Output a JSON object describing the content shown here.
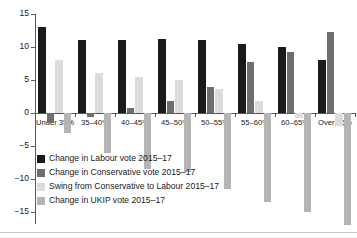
{
  "chart_data": {
    "type": "bar",
    "title": "",
    "xlabel": "",
    "ylabel": "",
    "ylim": [
      -20,
      15
    ],
    "yticks": [
      15,
      10,
      5,
      0,
      -5,
      -10,
      -15,
      -20
    ],
    "ytick_labels": [
      "15",
      "10",
      "5",
      "0",
      "−5",
      "−10",
      "−15",
      "−20"
    ],
    "grid": false,
    "legend_position": "lower-left-inside",
    "categories": [
      "Under 35%",
      "35–40%",
      "40–45%",
      "45–50%",
      "50–55%",
      "55–60%",
      "60–65%",
      "Over 65%"
    ],
    "series": [
      {
        "name": "Change in Labour vote 2015–17",
        "color": "#1a1a1a",
        "values": [
          13.0,
          11.0,
          11.0,
          11.2,
          11.0,
          10.5,
          10.0,
          8.0
        ]
      },
      {
        "name": "Change in Conservative vote 2015–17",
        "color": "#6e6e6e",
        "values": [
          -1.5,
          -0.6,
          0.8,
          1.8,
          4.0,
          7.8,
          9.2,
          12.3
        ]
      },
      {
        "name": "Swing from Conservative to Labour 2015–17",
        "color": "#dcdcdc",
        "values": [
          8.0,
          6.0,
          5.5,
          5.0,
          3.6,
          1.8,
          -0.8,
          -2.0
        ]
      },
      {
        "name": "Change in UKIP vote 2015–17",
        "color": "#b4b4b4",
        "values": [
          -3.0,
          -6.0,
          -8.5,
          -9.0,
          -11.5,
          -13.5,
          -15.0,
          -17.0
        ]
      }
    ]
  }
}
